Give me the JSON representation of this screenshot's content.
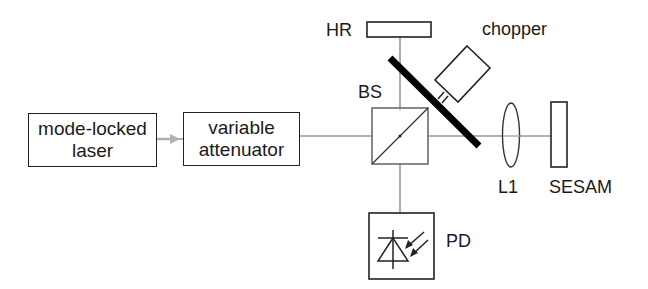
{
  "diagram": {
    "type": "optical setup",
    "components": {
      "laser": {
        "line1": "mode-locked",
        "line2": "laser"
      },
      "attenuator": {
        "line1": "variable",
        "line2": "attenuator"
      },
      "hr": {
        "label": "HR"
      },
      "chopper": {
        "label": "chopper"
      },
      "beam_splitter": {
        "label": "BS"
      },
      "lens": {
        "label": "L1"
      },
      "sesam": {
        "label": "SESAM"
      },
      "photodiode": {
        "label": "PD"
      }
    },
    "colors": {
      "outline": "#222222",
      "beam": "#999999",
      "arrow": "#b0b0b0",
      "chopper_blade": "#000000"
    }
  }
}
